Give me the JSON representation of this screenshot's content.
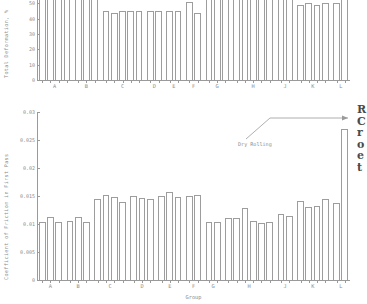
{
  "figure": {
    "annotation": {
      "label": "Dry Rolling"
    },
    "side_note_lines": [
      "R",
      "C",
      "r",
      "o",
      "e",
      "t"
    ]
  },
  "chart_data": [
    {
      "id": "total-deformation",
      "type": "bar",
      "title": "",
      "xlabel": "",
      "ylabel": "Total Deformation, %",
      "ylim": [
        0,
        60
      ],
      "yticks": [
        0,
        10,
        20,
        30,
        40,
        50,
        60
      ],
      "ytick_labels": [
        "0",
        "10",
        "20",
        "30",
        "40",
        "50",
        "60"
      ],
      "grid": false,
      "legend": "none",
      "categories": [
        "A",
        "B",
        "C",
        "D",
        "E",
        "F",
        "G",
        "H",
        "J",
        "K",
        "L"
      ],
      "groups": [
        {
          "label": "A",
          "values": [
            61,
            59,
            61,
            61
          ]
        },
        {
          "label": "B",
          "values": [
            61,
            61,
            61
          ]
        },
        {
          "label": "C",
          "values": [
            45,
            44,
            45,
            45,
            45
          ]
        },
        {
          "label": "D",
          "values": [
            45,
            45
          ]
        },
        {
          "label": "E",
          "values": [
            45,
            45
          ]
        },
        {
          "label": "F",
          "values": [
            51,
            44
          ]
        },
        {
          "label": "G",
          "values": [
            61,
            59,
            61
          ]
        },
        {
          "label": "H",
          "values": [
            61,
            61,
            61,
            61,
            61
          ]
        },
        {
          "label": "J",
          "values": [
            61,
            61
          ]
        },
        {
          "label": "K",
          "values": [
            49,
            50,
            49,
            50
          ]
        },
        {
          "label": "L",
          "values": [
            50,
            53
          ]
        }
      ]
    },
    {
      "id": "coefficient-of-friction",
      "type": "bar",
      "title": "",
      "xlabel": "Group",
      "ylabel": "Coefficient of Friction in First Pass",
      "ylim": [
        0,
        0.03
      ],
      "yticks": [
        0,
        0.005,
        0.01,
        0.015,
        0.02,
        0.025,
        0.03
      ],
      "ytick_labels": [
        "0",
        "0.005",
        "0.01",
        "0.015",
        "0.02",
        "0.025",
        "0.03"
      ],
      "grid": false,
      "legend": "none",
      "categories": [
        "A",
        "B",
        "C",
        "D",
        "E",
        "F",
        "G",
        "H",
        "J",
        "K",
        "L"
      ],
      "groups": [
        {
          "label": "A",
          "values": [
            0.0103,
            0.0113,
            0.0104
          ]
        },
        {
          "label": "B",
          "values": [
            0.0106,
            0.0112,
            0.0104
          ]
        },
        {
          "label": "C",
          "values": [
            0.0145,
            0.0152,
            0.0148,
            0.014
          ]
        },
        {
          "label": "D",
          "values": [
            0.015,
            0.0146,
            0.0144
          ]
        },
        {
          "label": "E",
          "values": [
            0.015,
            0.0158,
            0.0148
          ]
        },
        {
          "label": "F",
          "values": [
            0.015,
            0.0152
          ]
        },
        {
          "label": "G",
          "values": [
            0.0104,
            0.0104
          ]
        },
        {
          "label": "H",
          "values": [
            0.011,
            0.011,
            0.0128,
            0.0105,
            0.0102,
            0.0104
          ]
        },
        {
          "label": "J",
          "values": [
            0.0118,
            0.0114
          ]
        },
        {
          "label": "K",
          "values": [
            0.0141,
            0.013,
            0.0132,
            0.0144
          ]
        },
        {
          "label": "L",
          "values": [
            0.0138,
            0.027
          ]
        }
      ]
    }
  ]
}
